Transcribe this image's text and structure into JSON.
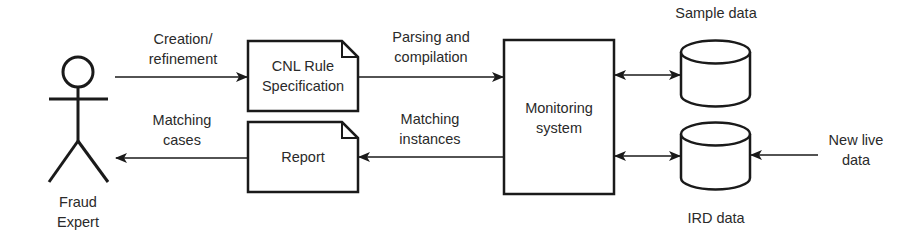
{
  "diagram": {
    "actor": {
      "label_line1": "Fraud",
      "label_line2": "Expert"
    },
    "nodes": {
      "cnl_rule": {
        "line1": "CNL Rule",
        "line2": "Specification",
        "shape": "document"
      },
      "report": {
        "line1": "Report",
        "shape": "document"
      },
      "monitoring": {
        "line1": "Monitoring",
        "line2": "system",
        "shape": "rectangle"
      },
      "sample_data": {
        "label": "Sample data",
        "shape": "database-cylinder"
      },
      "ird_data": {
        "label": "IRD data",
        "shape": "database-cylinder"
      }
    },
    "edges": {
      "creation": {
        "line1": "Creation/",
        "line2": "refinement",
        "from": "Fraud Expert",
        "to": "CNL Rule Specification"
      },
      "parsing": {
        "line1": "Parsing and",
        "line2": "compilation",
        "from": "CNL Rule Specification",
        "to": "Monitoring system"
      },
      "matching_instances": {
        "line1": "Matching",
        "line2": "instances",
        "from": "Monitoring system",
        "to": "Report"
      },
      "matching_cases": {
        "line1": "Matching",
        "line2": "cases",
        "from": "Report",
        "to": "Fraud Expert"
      },
      "sample_link": {
        "from": "Monitoring system",
        "to": "Sample data",
        "direction": "bidirectional"
      },
      "ird_link": {
        "from": "Monitoring system",
        "to": "IRD data",
        "direction": "bidirectional"
      },
      "new_live": {
        "line1": "New live",
        "line2": "data",
        "to": "IRD data"
      }
    },
    "colors": {
      "stroke": "#1a1a1a",
      "text": "#2a2a2a",
      "background": "#ffffff"
    }
  }
}
